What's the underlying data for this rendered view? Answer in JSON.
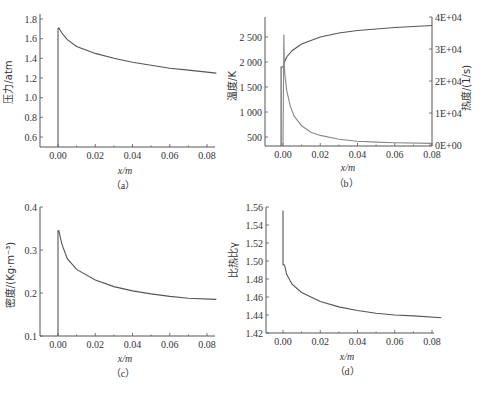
{
  "chart_data": [
    {
      "id": "a",
      "type": "line",
      "caption": "（a）",
      "xlabel": "x/m",
      "ylabel": "压力/atm",
      "xlim": [
        -0.01,
        0.085
      ],
      "ylim": [
        0.5,
        1.8
      ],
      "xticks": [
        "0.00",
        "0.02",
        "0.04",
        "0.06",
        "0.08"
      ],
      "yticks": [
        "0.6",
        "0.8",
        "1.0",
        "1.2",
        "1.4",
        "1.6",
        "1.8"
      ],
      "series": [
        {
          "name": "pressure",
          "x": [
            0.0,
            0.0,
            0.0005,
            0.002,
            0.005,
            0.01,
            0.02,
            0.03,
            0.04,
            0.05,
            0.06,
            0.07,
            0.085
          ],
          "y": [
            0.5,
            1.7,
            1.71,
            1.66,
            1.59,
            1.52,
            1.45,
            1.4,
            1.36,
            1.33,
            1.3,
            1.28,
            1.25
          ]
        }
      ]
    },
    {
      "id": "b",
      "type": "line",
      "caption": "（b）",
      "xlabel": "x/m",
      "ylabel": "温度/K",
      "ylabel_right": "热度/(1/s)",
      "xlim": [
        -0.01,
        0.08
      ],
      "ylim": [
        300,
        2900
      ],
      "ylim_right": [
        0,
        40000
      ],
      "xticks": [
        "0.00",
        "0.02",
        "0.04",
        "0.06",
        "0.08"
      ],
      "yticks": [
        "500",
        "1 000",
        "1 500",
        "2 000",
        "2 500"
      ],
      "yticks_right": [
        "0E+00",
        "1E+04",
        "2E+04",
        "3E+04",
        "4E+04"
      ],
      "series": [
        {
          "name": "temperature",
          "axis": "left",
          "x": [
            -0.001,
            -0.001,
            0.0,
            0.0005,
            0.001,
            0.002,
            0.005,
            0.01,
            0.02,
            0.03,
            0.04,
            0.05,
            0.06,
            0.07,
            0.08
          ],
          "y": [
            300,
            1900,
            1900,
            1950,
            2020,
            2100,
            2230,
            2360,
            2500,
            2580,
            2630,
            2660,
            2690,
            2710,
            2730
          ]
        },
        {
          "name": "heat_release_rate",
          "axis": "right",
          "x": [
            0.0,
            0.0005,
            0.0007,
            0.001,
            0.002,
            0.004,
            0.006,
            0.01,
            0.015,
            0.02,
            0.03,
            0.04,
            0.05,
            0.06,
            0.08
          ],
          "y": [
            0,
            34500,
            25000,
            22000,
            17000,
            12000,
            9000,
            6000,
            4000,
            3000,
            1800,
            1200,
            900,
            700,
            500
          ]
        }
      ]
    },
    {
      "id": "c",
      "type": "line",
      "caption": "（c）",
      "xlabel": "x/m",
      "ylabel": "密度/(Kg·m⁻³)",
      "xlim": [
        -0.01,
        0.085
      ],
      "ylim": [
        0.1,
        0.4
      ],
      "xticks": [
        "0.00",
        "0.02",
        "0.04",
        "0.06",
        "0.08"
      ],
      "yticks": [
        "0.1",
        "0.2",
        "0.3",
        "0.4"
      ],
      "series": [
        {
          "name": "density",
          "x": [
            0.0,
            0.0,
            0.0005,
            0.002,
            0.005,
            0.01,
            0.02,
            0.03,
            0.04,
            0.05,
            0.06,
            0.07,
            0.085
          ],
          "y": [
            0.1,
            0.345,
            0.345,
            0.315,
            0.28,
            0.255,
            0.23,
            0.215,
            0.205,
            0.198,
            0.192,
            0.188,
            0.185
          ]
        }
      ]
    },
    {
      "id": "d",
      "type": "line",
      "caption": "（d）",
      "xlabel": "x/m",
      "ylabel": "比热比γ",
      "xlim": [
        -0.01,
        0.085
      ],
      "ylim": [
        1.42,
        1.56
      ],
      "xticks": [
        "0.00",
        "0.02",
        "0.04",
        "0.06",
        "0.08"
      ],
      "yticks": [
        "1.42",
        "1.44",
        "1.46",
        "1.48",
        "1.50",
        "1.52",
        "1.54",
        "1.56"
      ],
      "series": [
        {
          "name": "specific_heat_ratio",
          "x": [
            0.0,
            0.0,
            0.0005,
            0.001,
            0.002,
            0.005,
            0.01,
            0.02,
            0.03,
            0.04,
            0.05,
            0.06,
            0.07,
            0.085
          ],
          "y": [
            1.556,
            1.496,
            1.496,
            1.494,
            1.485,
            1.474,
            1.465,
            1.455,
            1.449,
            1.445,
            1.442,
            1.44,
            1.439,
            1.437
          ]
        }
      ]
    }
  ],
  "panels": {
    "a": {
      "caption": "（a）",
      "xlabel": "x/m",
      "ylabel": "压力/atm"
    },
    "b": {
      "caption": "（b）",
      "xlabel": "x/m",
      "ylabel": "温度/K",
      "ylabel_right": "热度/(1/s)"
    },
    "c": {
      "caption": "（c）",
      "xlabel": "x/m",
      "ylabel": "密度/(Kg·m⁻³)"
    },
    "d": {
      "caption": "（d）",
      "xlabel": "x/m",
      "ylabel": "比热比γ"
    }
  }
}
